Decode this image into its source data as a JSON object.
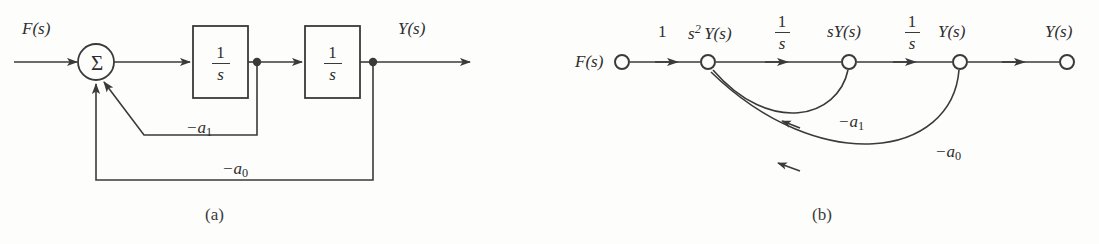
{
  "figure": {
    "background_color": "#fdfdfc",
    "line_color": "#3a3a3a",
    "text_color": "#2e2e2e"
  },
  "panel_a": {
    "caption": "(a)",
    "input_label": "F(s)",
    "output_label": "Y(s)",
    "summing_junction_symbol": "Σ",
    "block1": {
      "numerator": "1",
      "denominator": "s"
    },
    "block2": {
      "numerator": "1",
      "denominator": "s"
    },
    "inner_feedback_label": "−a",
    "inner_feedback_sub": "1",
    "outer_feedback_label": "−a",
    "outer_feedback_sub": "0"
  },
  "panel_b": {
    "caption": "(b)",
    "nodes": [
      {
        "label": "F(s)",
        "x": 622
      },
      {
        "label": "Y(s)",
        "prefix": "s",
        "prefix_sup": "2",
        "x": 708
      },
      {
        "label": "Y(s)",
        "prefix": "s",
        "x": 849
      },
      {
        "label": "Y(s)",
        "x": 960
      },
      {
        "label": "Y(s)",
        "x": 1067
      }
    ],
    "branch_gain_1": "1",
    "branch_gain_2": {
      "numerator": "1",
      "denominator": "s"
    },
    "branch_gain_3": {
      "numerator": "1",
      "denominator": "s"
    },
    "feedback_a1_label": "−a",
    "feedback_a1_sub": "1",
    "feedback_a0_label": "−a",
    "feedback_a0_sub": "0"
  }
}
